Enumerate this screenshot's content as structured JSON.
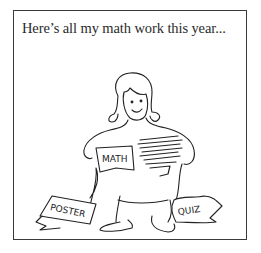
{
  "caption": "Here’s all my math work this year...",
  "paper_labels": {
    "math": "MATH",
    "poster": "POSTER",
    "quiz": "QUIZ"
  },
  "colors": {
    "ink": "#222222",
    "frame": "#3a3a3a",
    "background": "#ffffff"
  }
}
